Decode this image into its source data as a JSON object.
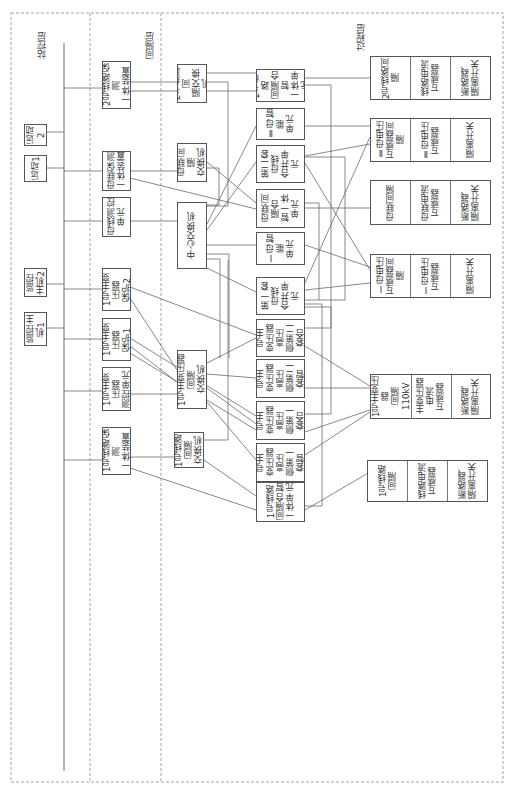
{
  "layers": {
    "station": "站控层",
    "bay": "间隔层",
    "process": "过程层"
  },
  "station_devices": [
    {
      "id": "yd2",
      "label": "远动2"
    },
    {
      "id": "yd1",
      "label": "远动1"
    },
    {
      "id": "jk2",
      "label": "监控主机2"
    },
    {
      "id": "jk1",
      "label": "监控主机1"
    }
  ],
  "bay_devices": [
    {
      "id": "l2pm",
      "label": "2号线路保测\n一体装置"
    },
    {
      "id": "mlpm",
      "label": "母联保测\n一体装置"
    },
    {
      "id": "mxck",
      "label": "母线测控\n单元"
    },
    {
      "id": "tp2",
      "label": "1号主变压器\n保护2"
    },
    {
      "id": "tp1",
      "label": "1号主变压器\n保护1"
    },
    {
      "id": "tck",
      "label": "1号主变压器\n测控单元"
    },
    {
      "id": "l1pm",
      "label": "1号线路保测\n一体装置"
    }
  ],
  "switches": [
    {
      "id": "sw_l2",
      "label": "2号线路间\n隔交换机"
    },
    {
      "id": "sw_ml",
      "label": "母联间隔\n交换机"
    },
    {
      "id": "sw_c",
      "label": "中心交换机"
    },
    {
      "id": "sw_t",
      "label": "1号主变压器间隔\n交换机"
    },
    {
      "id": "sw_l1",
      "label": "1号线路间隔\n交换机"
    }
  ],
  "merging_units": [
    {
      "id": "mu_l2",
      "label": "2号线路\n间隔合智\n一体单元"
    },
    {
      "id": "mu_b2",
      "label": "Ⅱ母智能\n单元"
    },
    {
      "id": "mu_s2",
      "label": "第二套母线\n合并单元"
    },
    {
      "id": "mu_ml",
      "label": "母联间隔合\n智一体单元"
    },
    {
      "id": "mu_b1",
      "label": "Ⅰ母智能\n单元"
    },
    {
      "id": "mu_s1",
      "label": "第一套母线\n合并单元"
    },
    {
      "id": "mu_t4",
      "label": "110kV1号主\n变压器高压\n侧第二套合\n并单元"
    },
    {
      "id": "mu_t3",
      "label": "110kV1号主\n变压器高压\n侧第二套智\n能终端"
    },
    {
      "id": "mu_t2",
      "label": "110kV1号主\n变压器高压\n侧第一套合\n并单元"
    },
    {
      "id": "mu_t1",
      "label": "110kV1号主\n变压器高压\n侧第一套智\n能终端"
    },
    {
      "id": "mu_l1",
      "label": "1号线路\n间隔合智\n一体单元"
    }
  ],
  "process_bays": [
    {
      "id": "p_l2",
      "cells": [
        "2号线路间隔",
        "线路电流\n互感器",
        "断路器、\n隔离开关"
      ]
    },
    {
      "id": "p_b2",
      "cells": [
        "Ⅱ母电压\n互感器间隔",
        "Ⅱ母电压\n互感器",
        "隔离开关"
      ]
    },
    {
      "id": "p_ml",
      "cells": [
        "母联间隔",
        "母联电流\n互感器",
        "断路器、\n隔离开关"
      ]
    },
    {
      "id": "p_b1",
      "cells": [
        "Ⅰ母电压\n互感器间隔",
        "Ⅰ母电压\n互感器",
        "隔离开关"
      ]
    },
    {
      "id": "p_t",
      "cells": [
        "1号主变压器\n间隔110kV",
        "主变压器电流\n互感器",
        "断路器、\n隔离开关"
      ]
    },
    {
      "id": "p_l1",
      "cells": [
        "1号线路间隔",
        "线路电流\n互感器",
        "断路器、\n隔离开关"
      ]
    }
  ],
  "colors": {
    "line": "#6a6a6a",
    "border": "#555555",
    "dash": "#8a8a8a"
  }
}
